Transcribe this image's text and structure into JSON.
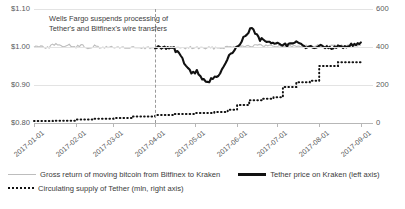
{
  "chart_data": {
    "type": "line",
    "title": "",
    "xlabel": "",
    "ylabel": "",
    "y_left": {
      "label": "",
      "ticks": [
        "$0.80",
        "$0.90",
        "$1.00",
        "$1.10"
      ],
      "lim": [
        0.8,
        1.1
      ]
    },
    "y_right": {
      "label": "",
      "ticks": [
        "0",
        "200",
        "400",
        "600"
      ],
      "lim": [
        0,
        600
      ]
    },
    "x_ticks": [
      "2017-01-01",
      "2017-02-01",
      "2017-03-01",
      "2017-04-01",
      "2017-05-01",
      "2017-06-01",
      "2017-07-01",
      "2017-08-01",
      "2017-09-01"
    ],
    "grid": true,
    "legend_position": "bottom",
    "annotations": [
      {
        "text_line_1": "Wells Fargo suspends processing of",
        "text_line_2": "Tether's and Bitfinex's wire transfers",
        "marker_x": "2017-04-01",
        "marker_style": "dashed-vertical"
      }
    ],
    "series": [
      {
        "name": "Gross return of moving bitcoin from Bitfinex to Kraken",
        "axis": "left",
        "color": "#bdbdbd",
        "style": "solid",
        "x": [
          "2017-01-01",
          "2017-01-06",
          "2017-01-11",
          "2017-01-16",
          "2017-01-21",
          "2017-01-26",
          "2017-01-31",
          "2017-02-05",
          "2017-02-10",
          "2017-02-15",
          "2017-02-20",
          "2017-02-25",
          "2017-03-02",
          "2017-03-07",
          "2017-03-12",
          "2017-03-17",
          "2017-03-22",
          "2017-03-27",
          "2017-04-01",
          "2017-04-06",
          "2017-04-11",
          "2017-04-16",
          "2017-04-21",
          "2017-04-26",
          "2017-05-01",
          "2017-05-11",
          "2017-05-21",
          "2017-06-01",
          "2017-06-15",
          "2017-07-01",
          "2017-07-15",
          "2017-08-01",
          "2017-08-15",
          "2017-09-01"
        ],
        "values": [
          1.0,
          1.004,
          0.998,
          1.008,
          1.001,
          1.006,
          0.999,
          1.004,
          0.998,
          1.002,
          0.997,
          1.001,
          0.998,
          1.0,
          0.997,
          0.999,
          0.996,
          0.998,
          1.0,
          0.998,
          0.996,
          0.999,
          0.997,
          0.998,
          0.998,
          0.997,
          0.999,
          1.002,
          1.004,
          1.003,
          1.002,
          1.003,
          1.002,
          1.004
        ]
      },
      {
        "name": "Tether price on Kraken (left axis)",
        "axis": "left",
        "color": "#111111",
        "style": "solid",
        "x": [
          "2017-04-01",
          "2017-04-08",
          "2017-04-15",
          "2017-04-20",
          "2017-04-24",
          "2017-04-28",
          "2017-05-02",
          "2017-05-06",
          "2017-05-10",
          "2017-05-14",
          "2017-05-18",
          "2017-05-22",
          "2017-05-26",
          "2017-05-30",
          "2017-06-03",
          "2017-06-07",
          "2017-06-12",
          "2017-06-18",
          "2017-06-24",
          "2017-07-01",
          "2017-07-08",
          "2017-07-15",
          "2017-07-22",
          "2017-08-01",
          "2017-08-10",
          "2017-08-20",
          "2017-09-01"
        ],
        "values": [
          1.0,
          0.999,
          0.996,
          0.975,
          0.95,
          0.93,
          0.935,
          0.915,
          0.905,
          0.918,
          0.925,
          0.945,
          0.975,
          0.99,
          1.01,
          1.03,
          1.05,
          1.02,
          1.015,
          1.01,
          1.005,
          1.012,
          1.0,
          1.002,
          0.998,
          1.002,
          1.012
        ]
      },
      {
        "name": "Circulating supply of Tether (mln, right axis)",
        "axis": "right",
        "color": "#111111",
        "style": "dotted",
        "x": [
          "2017-01-01",
          "2017-01-15",
          "2017-02-01",
          "2017-02-15",
          "2017-03-01",
          "2017-03-15",
          "2017-04-01",
          "2017-04-15",
          "2017-05-01",
          "2017-05-15",
          "2017-05-25",
          "2017-06-01",
          "2017-06-10",
          "2017-06-20",
          "2017-06-28",
          "2017-07-05",
          "2017-07-15",
          "2017-07-25",
          "2017-08-01",
          "2017-08-15",
          "2017-09-01"
        ],
        "values": [
          10,
          12,
          18,
          22,
          26,
          34,
          42,
          48,
          52,
          58,
          70,
          95,
          120,
          128,
          135,
          190,
          215,
          222,
          300,
          320,
          322
        ]
      }
    ]
  },
  "legend": {
    "items": [
      {
        "label": "Gross return of moving bitcoin from Bitfinex to Kraken",
        "marker": "gray-line"
      },
      {
        "label": "Tether price on Kraken (left axis)",
        "marker": "black-line"
      },
      {
        "label": "Circulating supply of Tether (mln, right axis)",
        "marker": "dotted-line"
      }
    ]
  }
}
